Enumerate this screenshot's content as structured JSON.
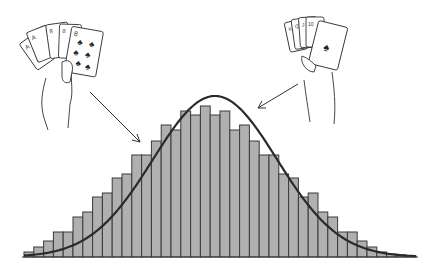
{
  "figure": {
    "left_hand": {
      "label": "hand-holding-clubs-flush",
      "visible_cards": [
        "A",
        "A",
        "8",
        "8",
        "8 of clubs"
      ]
    },
    "right_hand": {
      "label": "hand-holding-royal-cards",
      "visible_cards": [
        "K",
        "Q",
        "J",
        "10",
        "A of spades"
      ]
    }
  },
  "colors": {
    "bar_fill": "#b0b0b0",
    "bar_stroke": "#3a3a3a",
    "curve": "#2a2a2a",
    "background": "#ffffff",
    "ink": "#333333"
  },
  "chart_data": {
    "type": "bar",
    "title": "",
    "xlabel": "",
    "ylabel": "",
    "grid": false,
    "legend": "none",
    "overlay": "normal-curve",
    "categories": [
      1,
      2,
      3,
      4,
      5,
      6,
      7,
      8,
      9,
      10,
      11,
      12,
      13,
      14,
      15,
      16,
      17,
      18,
      19,
      20,
      21,
      22,
      23,
      24,
      25,
      26,
      27,
      28,
      29,
      30,
      31,
      32,
      33,
      34,
      35,
      36,
      37,
      38,
      39,
      40
    ],
    "values": [
      5,
      10,
      16,
      25,
      25,
      40,
      45,
      60,
      64,
      79,
      83,
      102,
      102,
      116,
      132,
      127,
      146,
      142,
      151,
      142,
      146,
      127,
      132,
      116,
      102,
      102,
      83,
      79,
      60,
      64,
      45,
      40,
      25,
      25,
      16,
      10,
      5,
      3,
      2,
      1
    ],
    "ylim": [
      0,
      165
    ]
  }
}
